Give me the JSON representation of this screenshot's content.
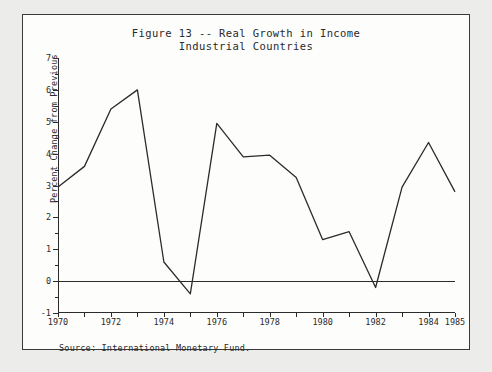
{
  "figure": {
    "title_line1": "Figure 13 -- Real Growth in Income",
    "title_line2": "Industrial Countries",
    "source_note": "Source:   International Monetary Fund."
  },
  "chart_data": {
    "type": "line",
    "title": "Figure 13 -- Real Growth in Income\nIndustrial Countries",
    "xlabel": "",
    "ylabel": "Percent Change from Previous",
    "xlim": [
      1970,
      1985
    ],
    "ylim": [
      -1,
      7
    ],
    "grid": false,
    "legend": "none",
    "x_tick_labels": [
      "1970",
      "1972",
      "1974",
      "1976",
      "1978",
      "1980",
      "1982",
      "1984",
      "1985"
    ],
    "x_tick_values": [
      1970,
      1972,
      1974,
      1976,
      1978,
      1980,
      1982,
      1984,
      1985
    ],
    "x_minor_interval": 1,
    "y_tick_labels": [
      "-1",
      "0",
      "1",
      "2",
      "3",
      "4",
      "5",
      "6",
      "7"
    ],
    "y_tick_values": [
      -1,
      0,
      1,
      2,
      3,
      4,
      5,
      6,
      7
    ],
    "y_minor_interval": 0.5,
    "zero_reference_line": 0,
    "line_color": "#2b2b2b",
    "x": [
      1970,
      1971,
      1972,
      1973,
      1974,
      1975,
      1976,
      1977,
      1978,
      1979,
      1980,
      1981,
      1982,
      1983,
      1984,
      1985
    ],
    "values": [
      2.95,
      3.6,
      5.4,
      6.0,
      0.6,
      -0.4,
      4.95,
      3.9,
      3.95,
      3.25,
      1.3,
      1.55,
      -0.2,
      2.95,
      4.35,
      2.8
    ],
    "series": [
      {
        "name": "Real growth in income, industrial countries",
        "values": [
          2.95,
          3.6,
          5.4,
          6.0,
          0.6,
          -0.4,
          4.95,
          3.9,
          3.95,
          3.25,
          1.3,
          1.55,
          -0.2,
          2.95,
          4.35,
          2.8
        ]
      }
    ]
  }
}
